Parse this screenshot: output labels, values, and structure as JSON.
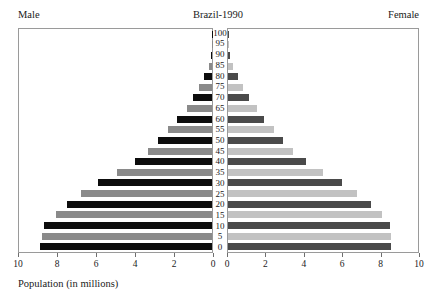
{
  "header": {
    "title": "Brazil-1990",
    "left_label": "Male",
    "right_label": "Female"
  },
  "axis": {
    "caption": "Population (in millions)",
    "male_tick_labels": [
      "10",
      "8",
      "6",
      "4",
      "2",
      "0"
    ],
    "female_tick_labels": [
      "0",
      "2",
      "4",
      "6",
      "8",
      "10"
    ],
    "max": 10,
    "tick_step": 2
  },
  "colors": {
    "male_dark": "#0d0d0d",
    "male_light": "#8a8a8a",
    "female_dark": "#4a4a4a",
    "female_light": "#c2c2c2",
    "frame": "#9a9a9a",
    "text": "#1a1a1a",
    "background": "#ffffff"
  },
  "chart_data": {
    "type": "bar",
    "subtype": "population-pyramid",
    "title": "Brazil-1990",
    "xlabel": "Population (in millions)",
    "ylabel": "Age",
    "xlim": [
      0,
      10
    ],
    "grid": false,
    "legend": "none",
    "categories": [
      "0",
      "5",
      "10",
      "15",
      "20",
      "25",
      "30",
      "35",
      "40",
      "45",
      "50",
      "55",
      "60",
      "65",
      "70",
      "75",
      "80",
      "85",
      "90",
      "95",
      "100"
    ],
    "series": [
      {
        "name": "Male",
        "side": "left",
        "values": [
          8.9,
          8.8,
          8.7,
          8.1,
          7.5,
          6.8,
          5.9,
          4.9,
          4.0,
          3.3,
          2.8,
          2.3,
          1.8,
          1.3,
          1.0,
          0.65,
          0.4,
          0.18,
          0.06,
          0.02,
          0.01
        ]
      },
      {
        "name": "Female",
        "side": "right",
        "values": [
          8.6,
          8.6,
          8.5,
          8.1,
          7.5,
          6.8,
          6.0,
          5.0,
          4.1,
          3.4,
          2.9,
          2.4,
          1.9,
          1.5,
          1.1,
          0.8,
          0.5,
          0.25,
          0.09,
          0.03,
          0.01
        ]
      }
    ]
  }
}
